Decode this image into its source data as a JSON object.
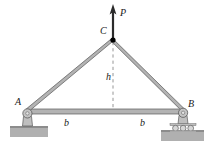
{
  "figure": {
    "background_color": "#ffffff"
  },
  "labels": {
    "load": "P",
    "apex_joint": "C",
    "left_support": "A",
    "right_support": "B",
    "height": "h",
    "base_left": "b",
    "base_right": "b"
  },
  "colors": {
    "member_fill": "#b3b3b3",
    "member_stroke": "#4d4d4d",
    "support_fill": "#bfbfbf",
    "support_stroke": "#595959",
    "ground_fill": "#b0b0b0",
    "arrow": "#2b2b2b",
    "joint_dot": "#000000",
    "dashed_line": "#808080",
    "text": "#1a1a1a"
  },
  "geometry": {
    "apex": {
      "x": 113,
      "y": 40
    },
    "left_support": {
      "x": 27,
      "y": 111
    },
    "right_support": {
      "x": 183,
      "y": 111
    },
    "load_arrow_tip": {
      "x": 113,
      "y": 5
    },
    "height_line_bottom": {
      "x": 113,
      "y": 111
    }
  },
  "supports": {
    "left_type": "pin-support",
    "right_type": "roller-support",
    "roller_count": 3
  }
}
